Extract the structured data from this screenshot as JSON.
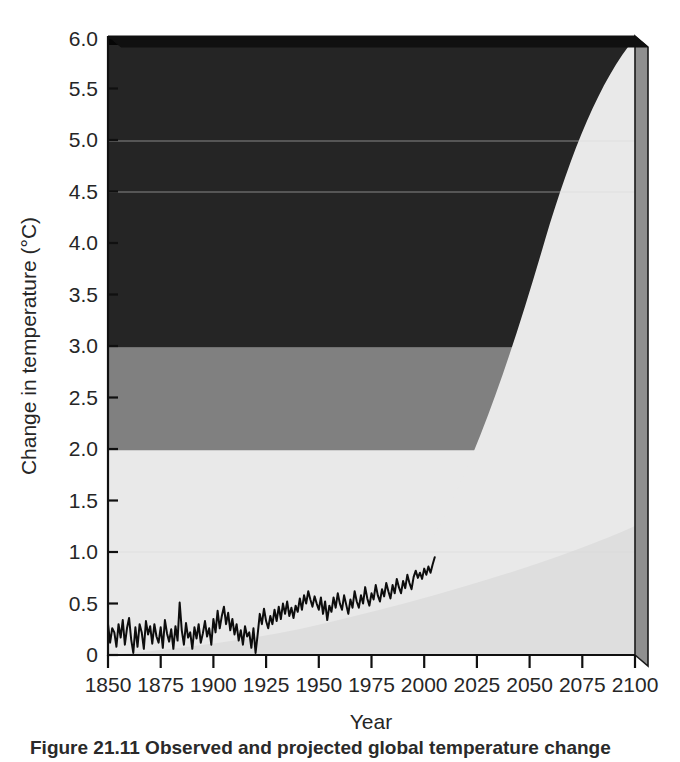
{
  "figure": {
    "caption_partial": "Figure 21.11 Observed and projected global temperature change"
  },
  "chart_data": {
    "type": "area",
    "title": "",
    "xlabel": "Year",
    "ylabel": "Change in temperature (°C)",
    "xlim": [
      1850,
      2100
    ],
    "ylim": [
      0,
      6.0
    ],
    "grid": false,
    "legend_position": "none",
    "xticks": [
      1850,
      1875,
      1900,
      1925,
      1950,
      1975,
      2000,
      2025,
      2050,
      2075,
      2100
    ],
    "xtick_labels": [
      "1850",
      "1875",
      "1900",
      "1925",
      "1950",
      "1975",
      "2000",
      "2025",
      "2050",
      "2075",
      "2100"
    ],
    "yticks": [
      0,
      0.5,
      1.0,
      1.5,
      2.0,
      2.5,
      3.0,
      3.5,
      4.0,
      4.5,
      5.0,
      5.5,
      6.0
    ],
    "ytick_labels": [
      "0",
      "0.5",
      "1.0",
      "1.5",
      "2.0",
      "2.5",
      "3.0",
      "3.5",
      "4.0",
      "4.5",
      "5.0",
      "5.5",
      "6.0"
    ],
    "risk_bands": [
      {
        "name": "low-risk-band",
        "label": "Below 2 °C",
        "from": 0,
        "to": 2.0,
        "color": "#e9e9e9"
      },
      {
        "name": "medium-risk-band",
        "label": "2 to 3 °C",
        "from": 2.0,
        "to": 3.0,
        "color": "#808080"
      },
      {
        "name": "high-risk-band",
        "label": "Above 3 °C",
        "from": 3.0,
        "to": 6.0,
        "color": "#252525"
      }
    ],
    "series": [
      {
        "name": "observed-temperature",
        "label": "Observed annual global temperature change",
        "type": "line",
        "color": "#0d0d0d",
        "x_start": 1850,
        "x_end": 2005,
        "values": [
          0.3,
          0.12,
          0.26,
          0.22,
          0.08,
          0.3,
          0.17,
          0.34,
          0.1,
          0.26,
          0.36,
          0.15,
          0.02,
          0.27,
          0.08,
          0.3,
          0.22,
          0.06,
          0.33,
          0.2,
          0.28,
          0.11,
          0.3,
          0.18,
          0.12,
          0.27,
          0.07,
          0.34,
          0.21,
          0.13,
          0.25,
          0.06,
          0.28,
          0.14,
          0.51,
          0.24,
          0.1,
          0.31,
          0.17,
          0.22,
          0.06,
          0.27,
          0.16,
          0.3,
          0.12,
          0.21,
          0.33,
          0.18,
          0.26,
          0.1,
          0.35,
          0.22,
          0.43,
          0.26,
          0.38,
          0.47,
          0.3,
          0.41,
          0.24,
          0.35,
          0.2,
          0.3,
          0.14,
          0.24,
          0.1,
          0.28,
          0.18,
          0.22,
          0.07,
          0.26,
          0.02,
          0.2,
          0.4,
          0.3,
          0.45,
          0.33,
          0.26,
          0.38,
          0.3,
          0.44,
          0.33,
          0.47,
          0.35,
          0.5,
          0.4,
          0.52,
          0.38,
          0.46,
          0.36,
          0.48,
          0.42,
          0.55,
          0.44,
          0.58,
          0.5,
          0.62,
          0.54,
          0.47,
          0.57,
          0.5,
          0.44,
          0.56,
          0.4,
          0.52,
          0.34,
          0.48,
          0.42,
          0.56,
          0.46,
          0.6,
          0.5,
          0.44,
          0.58,
          0.49,
          0.4,
          0.54,
          0.46,
          0.62,
          0.52,
          0.46,
          0.58,
          0.5,
          0.66,
          0.55,
          0.48,
          0.6,
          0.54,
          0.68,
          0.58,
          0.52,
          0.64,
          0.57,
          0.7,
          0.62,
          0.55,
          0.68,
          0.6,
          0.74,
          0.66,
          0.6,
          0.72,
          0.65,
          0.78,
          0.7,
          0.64,
          0.76,
          0.82,
          0.75,
          0.8,
          0.74,
          0.84,
          0.78,
          0.86,
          0.8,
          0.88,
          0.95
        ]
      },
      {
        "name": "projection-upper-bound",
        "label": "Upper bound of projected warming",
        "type": "envelope-upper",
        "color": "#e9e9e9",
        "x_start": 2000,
        "x_end": 2100,
        "value_at_2100": 6.0,
        "value_at_2050": 2.1,
        "value_at_2025": 1.0
      },
      {
        "name": "projection-lower-bound",
        "label": "Lower bound of projected warming",
        "type": "envelope-lower",
        "color": "#dedede",
        "x_start": 1900,
        "x_end": 2100,
        "value_at_2100": 1.25,
        "value_at_2050": 0.72,
        "value_at_2000": 0.42
      }
    ]
  }
}
